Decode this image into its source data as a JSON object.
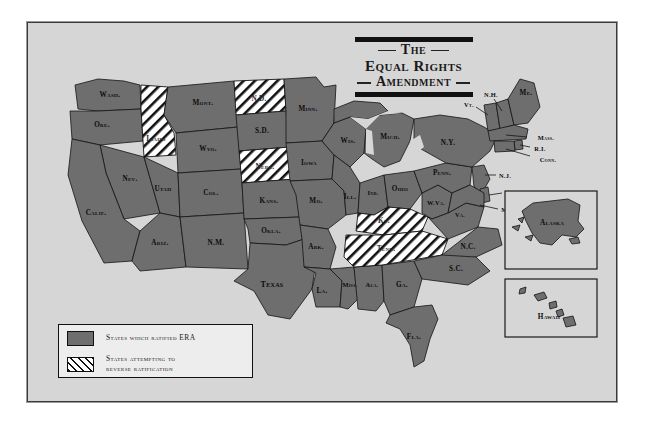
{
  "title": {
    "line1": "The",
    "line2": "Equal Rights",
    "line3": "Amendment"
  },
  "legend": {
    "items": [
      {
        "swatch": "solid-gray",
        "label": "States which ratified ERA"
      },
      {
        "swatch": "diagonal-hatch",
        "label_line1": "States attempting to",
        "label_line2": "reverse ratification"
      }
    ]
  },
  "map": {
    "insets": [
      {
        "name": "alaska",
        "label": "Alaska"
      },
      {
        "name": "hawaii",
        "label": "Hawaii"
      }
    ],
    "states_ratified": [
      {
        "code": "WASH.",
        "label": "Wash."
      },
      {
        "code": "ORE.",
        "label": "Ore."
      },
      {
        "code": "MONT.",
        "label": "Mont."
      },
      {
        "code": "WYO.",
        "label": "Wyo."
      },
      {
        "code": "NEV.",
        "label": "Nev."
      },
      {
        "code": "CALIF.",
        "label": "Calif."
      },
      {
        "code": "UTAH",
        "label": "Utah"
      },
      {
        "code": "ARIZ.",
        "label": "Ariz."
      },
      {
        "code": "COL.",
        "label": "Col."
      },
      {
        "code": "N.M.",
        "label": "N.M."
      },
      {
        "code": "S.D.",
        "label": "S.D."
      },
      {
        "code": "KANS.",
        "label": "Kans."
      },
      {
        "code": "OKLA.",
        "label": "Okla."
      },
      {
        "code": "TEXAS",
        "label": "Texas"
      },
      {
        "code": "MINN.",
        "label": "Minn."
      },
      {
        "code": "IOWA",
        "label": "Iowa"
      },
      {
        "code": "MO.",
        "label": "Mo."
      },
      {
        "code": "ARK.",
        "label": "Ark."
      },
      {
        "code": "LA.",
        "label": "La."
      },
      {
        "code": "WIS.",
        "label": "Wis."
      },
      {
        "code": "ILL.",
        "label": "Ill."
      },
      {
        "code": "MISS.",
        "label": "Miss."
      },
      {
        "code": "ALA.",
        "label": "Ala."
      },
      {
        "code": "GA.",
        "label": "Ga."
      },
      {
        "code": "FLA.",
        "label": "Fla."
      },
      {
        "code": "MICH.",
        "label": "Mich."
      },
      {
        "code": "IND.",
        "label": "Ind."
      },
      {
        "code": "OHIO",
        "label": "Ohio"
      },
      {
        "code": "W.VA.",
        "label": "W.Va."
      },
      {
        "code": "VA.",
        "label": "Va."
      },
      {
        "code": "N.C.",
        "label": "N.C."
      },
      {
        "code": "S.C.",
        "label": "S.C."
      },
      {
        "code": "PENN.",
        "label": "Penn."
      },
      {
        "code": "N.Y.",
        "label": "N.Y."
      },
      {
        "code": "VT.",
        "label": "Vt."
      },
      {
        "code": "N.H.",
        "label": "N.H."
      },
      {
        "code": "ME.",
        "label": "Me."
      },
      {
        "code": "MASS.",
        "label": "Mass."
      },
      {
        "code": "R.I.",
        "label": "R.I."
      },
      {
        "code": "CONN.",
        "label": "Conn."
      },
      {
        "code": "N.J.",
        "label": "N.J."
      },
      {
        "code": "DEL.",
        "label": "Del."
      },
      {
        "code": "MD.",
        "label": "Md."
      },
      {
        "code": "ALASKA",
        "label": "Alaska"
      },
      {
        "code": "HAWAII",
        "label": "Hawaii"
      }
    ],
    "states_reversing": [
      {
        "code": "IDAHO",
        "label": "Idaho"
      },
      {
        "code": "N.D.",
        "label": "N.D."
      },
      {
        "code": "NEBR.",
        "label": "Nebr."
      },
      {
        "code": "KY.",
        "label": "Ky."
      },
      {
        "code": "TENN.",
        "label": "Tenn."
      }
    ]
  },
  "colors": {
    "ratified_fill": "#6e6e6e",
    "reversing_fill": "#ffffff",
    "hatch_line": "#111111",
    "map_background": "#d6d6d6",
    "border": "#1a1a1a",
    "page": "#ffffff"
  }
}
